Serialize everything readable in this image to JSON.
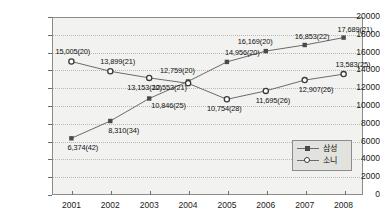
{
  "chart_data": {
    "type": "line",
    "title": "",
    "xlabel": "",
    "ylabel": "",
    "ylim": [
      0,
      20000
    ],
    "ytick_step": 2000,
    "grid": true,
    "legend_position": "bottom-right",
    "categories": [
      "2001",
      "2002",
      "2003",
      "2004",
      "2005",
      "2006",
      "2007",
      "2008"
    ],
    "yticks": [
      "0",
      "2000",
      "4000",
      "6000",
      "8000",
      "10000",
      "12000",
      "14000",
      "16000",
      "18000",
      "20000"
    ],
    "series": [
      {
        "name": "삼성",
        "marker": "filled-square",
        "values": [
          6374,
          8310,
          10846,
          12759,
          14956,
          16169,
          16853,
          17689
        ],
        "labels": [
          "6,374(42)",
          "8,310(34)",
          "10,846(25)",
          "12,759(20)",
          "14,956(20)",
          "16,169(20)",
          "16,853(22)",
          "17,689(21)"
        ]
      },
      {
        "name": "소니",
        "marker": "open-circle",
        "values": [
          15005,
          13899,
          13153,
          12553,
          10754,
          11695,
          12907,
          13583
        ],
        "labels": [
          "15,005(20)",
          "13,899(21)",
          "13,153(20)",
          "12,553(21)",
          "10,754(28)",
          "11,695(26)",
          "12,907(26)",
          "13,583(25)"
        ]
      }
    ],
    "colors": {
      "line": "#6b6b6b",
      "samsung_marker": "#4a4a4a",
      "sony_marker": "#3a3a3a",
      "plot_background": "#f2f2f0",
      "frame": "#8c8c8c",
      "gridline": "#b9b9b4",
      "text": "#111111"
    }
  },
  "legend": {
    "items": [
      {
        "label": "삼성"
      },
      {
        "label": "소니"
      }
    ]
  }
}
